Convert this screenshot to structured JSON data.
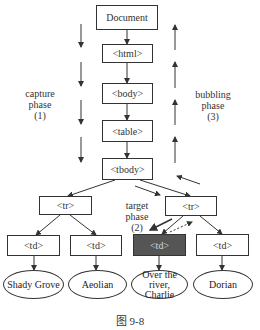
{
  "diagram": {
    "nodes": {
      "document": "Document",
      "html": "<html>",
      "body": "<body>",
      "table": "<table>",
      "tbody": "<tbody>",
      "tr_left": "<tr>",
      "tr_right": "<tr>",
      "td1": "<td>",
      "td2": "<td>",
      "td3": "<td>",
      "td4": "<td>"
    },
    "leaves": {
      "leaf1": "Shady Grove",
      "leaf2": "Aeolian",
      "leaf3_line1": "Over the river,",
      "leaf3_line2": "Charlie",
      "leaf4": "Dorian"
    },
    "phases": {
      "capture": {
        "line1": "capture",
        "line2": "phase",
        "line3": "(1)"
      },
      "target": {
        "line1": "target",
        "line2": "phase",
        "line3": "(2)"
      },
      "bubbling": {
        "line1": "bubbling",
        "line2": "phase",
        "line3": "(3)"
      }
    },
    "target_node_color": "#555555"
  },
  "caption": "图 9-8"
}
